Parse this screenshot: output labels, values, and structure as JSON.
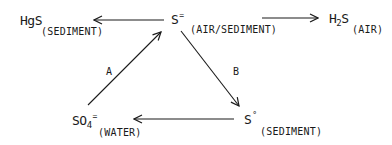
{
  "diagram": {
    "nodes": {
      "hgs": {
        "formula": "HgS",
        "phase": "(SEDIMENT)"
      },
      "sulfide": {
        "formula": "S",
        "charge": "=",
        "phase": "(AIR/SEDIMENT)"
      },
      "h2s": {
        "formula_pre": "H",
        "subscript": "2",
        "formula_post": "S",
        "phase": "(AIR)"
      },
      "sulfate": {
        "formula": "SO",
        "subscript": "4",
        "charge": "=",
        "phase": "(WATER)"
      },
      "elemental_sulfur": {
        "formula": "S",
        "superscript": "°",
        "phase": "(SEDIMENT)"
      }
    },
    "edges": [
      {
        "from": "sulfide",
        "to": "hgs",
        "label": ""
      },
      {
        "from": "sulfide",
        "to": "h2s",
        "label": ""
      },
      {
        "from": "sulfate",
        "to": "sulfide",
        "label": "A"
      },
      {
        "from": "sulfide",
        "to": "elemental_sulfur",
        "label": "B"
      },
      {
        "from": "elemental_sulfur",
        "to": "sulfate",
        "label": ""
      }
    ],
    "edge_labels": {
      "a": "A",
      "b": "B"
    },
    "colors": {
      "ink": "#1a1a1a",
      "background": "#ffffff"
    }
  }
}
